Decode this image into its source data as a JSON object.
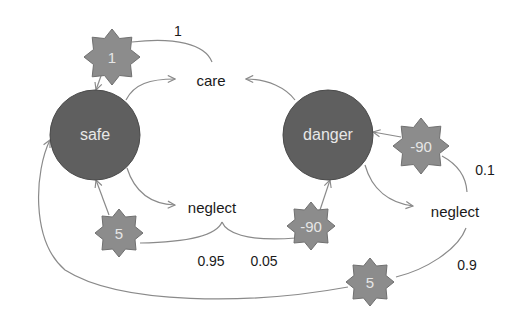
{
  "diagram": {
    "type": "markov-decision-process",
    "colors": {
      "state_fill": "#5f5f5f",
      "state_stroke": "#4a4a4a",
      "reward_fill": "#8c8c8c",
      "reward_stroke": "#707070",
      "edge": "#8a8a8a",
      "text": "#1a1a1a",
      "light_text": "#e8e8e8"
    },
    "states": [
      {
        "id": "safe",
        "label": "safe"
      },
      {
        "id": "danger",
        "label": "danger"
      }
    ],
    "actions": [
      {
        "id": "safe-care",
        "label": "care"
      },
      {
        "id": "safe-neglect",
        "label": "neglect"
      },
      {
        "id": "danger-neglect",
        "label": "neglect"
      }
    ],
    "rewards": [
      {
        "id": "r-care",
        "label": "1"
      },
      {
        "id": "r-danger-stay",
        "label": "-90"
      },
      {
        "id": "r-safe-neglect-safe",
        "label": "5"
      },
      {
        "id": "r-safe-neglect-danger",
        "label": "-90"
      },
      {
        "id": "r-danger-neglect-safe",
        "label": "5"
      }
    ],
    "probabilities": [
      {
        "id": "p-care",
        "label": "1"
      },
      {
        "id": "p-danger-neglect-danger",
        "label": "0.1"
      },
      {
        "id": "p-safe-neglect-safe",
        "label": "0.95"
      },
      {
        "id": "p-safe-neglect-danger",
        "label": "0.05"
      },
      {
        "id": "p-danger-neglect-safe",
        "label": "0.9"
      }
    ],
    "transitions": [
      {
        "from": "safe",
        "action": "care",
        "to": "safe",
        "prob": "1",
        "reward": "1"
      },
      {
        "from": "danger",
        "action": "care",
        "to": "safe",
        "prob": "1",
        "reward": "1"
      },
      {
        "from": "safe",
        "action": "neglect",
        "to": "safe",
        "prob": "0.95",
        "reward": "5"
      },
      {
        "from": "safe",
        "action": "neglect",
        "to": "danger",
        "prob": "0.05",
        "reward": "-90"
      },
      {
        "from": "danger",
        "action": "neglect",
        "to": "danger",
        "prob": "0.1",
        "reward": "-90"
      },
      {
        "from": "danger",
        "action": "neglect",
        "to": "safe",
        "prob": "0.9",
        "reward": "5"
      }
    ]
  }
}
